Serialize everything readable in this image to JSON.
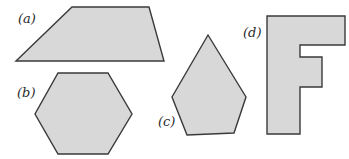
{
  "figure": {
    "background": "#ffffff",
    "fill_color": "#d8d8d8",
    "stroke_color": "#3a3a3a",
    "shapes": [
      {
        "id": "a",
        "label": "(a)",
        "kind": "trapezoid",
        "points": "16,61 72,7 149,7 164,61",
        "label_pos": {
          "x": 18,
          "y": 12
        }
      },
      {
        "id": "b",
        "label": "(b)",
        "kind": "hexagon",
        "points": "58,73 108,73 132,114 108,154 58,154 35,114",
        "label_pos": {
          "x": 17,
          "y": 86
        }
      },
      {
        "id": "c",
        "label": "(c)",
        "kind": "pentagon",
        "points": "208,35 246,97 234,133 187,135 172,97",
        "label_pos": {
          "x": 158,
          "y": 115
        }
      },
      {
        "id": "d",
        "label": "(d)",
        "kind": "letter-F",
        "points": "267,16 345,16 345,45 300,45 300,57 322,57 322,87 300,87 300,134 267,134",
        "label_pos": {
          "x": 243,
          "y": 26
        }
      }
    ]
  }
}
